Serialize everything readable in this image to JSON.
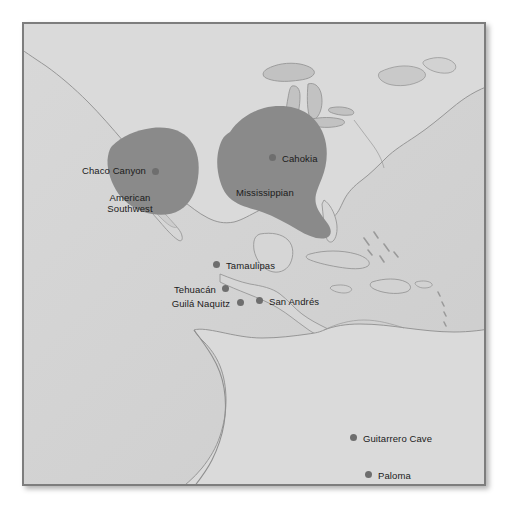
{
  "figure": {
    "name": "archaeological-sites-map-americas",
    "background_color": "#d4d4d4",
    "border_color": "#7d7d7d",
    "land_color": "#d9d9d9",
    "water_color": "#cfcfcf",
    "coastline_color": "#8f8f8f",
    "region_fill_color": "#8a8a8a",
    "dot_color": "#6e6e6e",
    "label_color": "#1b1b1b"
  },
  "regions": [
    {
      "id": "american-southwest",
      "label_line1": "American",
      "label_line2": "Southwest",
      "label_x": 106,
      "label_y": 168,
      "fill": "#8a8a8a"
    },
    {
      "id": "mississippian",
      "label": "Mississippian",
      "label_x": 234,
      "label_y": 165,
      "fill": "#8a8a8a"
    }
  ],
  "sites": [
    {
      "id": "chaco-canyon",
      "label": "Chaco Canyon",
      "dot_x": 132,
      "dot_y": 148,
      "label_x": 58,
      "label_y": 142,
      "anchor": "right"
    },
    {
      "id": "cahokia",
      "label": "Cahokia",
      "dot_x": 249,
      "dot_y": 134,
      "label_x": 260,
      "label_y": 131,
      "anchor": "left"
    },
    {
      "id": "tamaulipas",
      "label": "Tamaulipas",
      "dot_x": 193,
      "dot_y": 241,
      "label_x": 205,
      "label_y": 237,
      "anchor": "left"
    },
    {
      "id": "tehuacan",
      "label": "Tehuacán",
      "dot_x": 202,
      "dot_y": 265,
      "label_x": 145,
      "label_y": 261,
      "anchor": "right"
    },
    {
      "id": "guila-naquitz",
      "label": "Guilá Naquitz",
      "dot_x": 217,
      "dot_y": 279,
      "label_x": 143,
      "label_y": 275,
      "anchor": "right"
    },
    {
      "id": "san-andres",
      "label": "San Andrés",
      "dot_x": 236,
      "dot_y": 277,
      "label_x": 247,
      "label_y": 274,
      "anchor": "left"
    },
    {
      "id": "guitarrero-cave",
      "label": "Guitarrero Cave",
      "dot_x": 330,
      "dot_y": 414,
      "label_x": 342,
      "label_y": 410,
      "anchor": "left"
    },
    {
      "id": "paloma",
      "label": "Paloma",
      "dot_x": 345,
      "dot_y": 451,
      "label_x": 357,
      "label_y": 447,
      "anchor": "left"
    }
  ]
}
